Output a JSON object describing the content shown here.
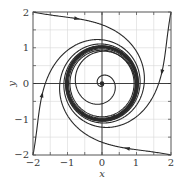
{
  "figure": {
    "type": "phase-portrait",
    "xlabel": "x",
    "ylabel": "y",
    "xlim": [
      -2,
      2
    ],
    "ylim": [
      -2,
      2
    ],
    "x_tick_labels": [
      "−2",
      "−1",
      "0",
      "1",
      "2"
    ],
    "y_tick_labels": [
      "2",
      "1",
      "0",
      "−1",
      "−2"
    ],
    "grid_step": 0.5,
    "colors": {
      "curve": "#2a2a2a",
      "grid": "#d8d8d8",
      "frame": "#555555",
      "axis": "#2a2a2a"
    },
    "limit_cycle_radius": 1.0,
    "equilibrium": [
      0,
      0
    ]
  }
}
